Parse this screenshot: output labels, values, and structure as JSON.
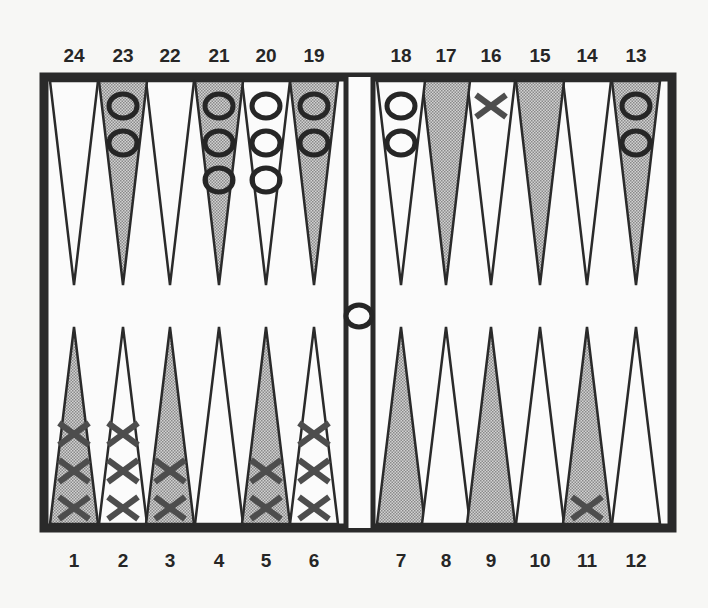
{
  "board": {
    "title": "Backgammon position",
    "colors": {
      "background": "#f7f7f5",
      "frame": "#2a2a2a",
      "light_point": "#fbfbfb",
      "dark_point": "#bdbdbd",
      "o_checker_stroke": "#262626",
      "x_checker": "#4d4d4d"
    },
    "top_labels": [
      "24",
      "23",
      "22",
      "21",
      "20",
      "19",
      "18",
      "17",
      "16",
      "15",
      "14",
      "13"
    ],
    "bottom_labels": [
      "1",
      "2",
      "3",
      "4",
      "5",
      "6",
      "7",
      "8",
      "9",
      "10",
      "11",
      "12"
    ],
    "points": [
      {
        "number": 1,
        "shade": "dark",
        "player": "X",
        "count": 3
      },
      {
        "number": 2,
        "shade": "light",
        "player": "X",
        "count": 3
      },
      {
        "number": 3,
        "shade": "dark",
        "player": "X",
        "count": 2
      },
      {
        "number": 4,
        "shade": "light",
        "player": "",
        "count": 0
      },
      {
        "number": 5,
        "shade": "dark",
        "player": "X",
        "count": 2
      },
      {
        "number": 6,
        "shade": "light",
        "player": "X",
        "count": 3
      },
      {
        "number": 7,
        "shade": "dark",
        "player": "",
        "count": 0
      },
      {
        "number": 8,
        "shade": "light",
        "player": "",
        "count": 0
      },
      {
        "number": 9,
        "shade": "dark",
        "player": "",
        "count": 0
      },
      {
        "number": 10,
        "shade": "light",
        "player": "",
        "count": 0
      },
      {
        "number": 11,
        "shade": "dark",
        "player": "X",
        "count": 1
      },
      {
        "number": 12,
        "shade": "light",
        "player": "",
        "count": 0
      },
      {
        "number": 13,
        "shade": "dark",
        "player": "O",
        "count": 2
      },
      {
        "number": 14,
        "shade": "light",
        "player": "",
        "count": 0
      },
      {
        "number": 15,
        "shade": "dark",
        "player": "",
        "count": 0
      },
      {
        "number": 16,
        "shade": "light",
        "player": "X",
        "count": 1
      },
      {
        "number": 17,
        "shade": "dark",
        "player": "",
        "count": 0
      },
      {
        "number": 18,
        "shade": "light",
        "player": "O",
        "count": 2
      },
      {
        "number": 19,
        "shade": "dark",
        "player": "O",
        "count": 2
      },
      {
        "number": 20,
        "shade": "light",
        "player": "O",
        "count": 3
      },
      {
        "number": 21,
        "shade": "dark",
        "player": "O",
        "count": 3
      },
      {
        "number": 22,
        "shade": "light",
        "player": "",
        "count": 0
      },
      {
        "number": 23,
        "shade": "dark",
        "player": "O",
        "count": 2
      },
      {
        "number": 24,
        "shade": "light",
        "player": "",
        "count": 0
      }
    ],
    "bar": [
      {
        "player": "O",
        "count": 1
      }
    ]
  }
}
